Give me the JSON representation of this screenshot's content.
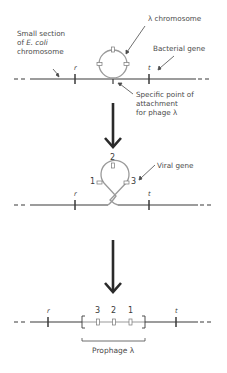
{
  "stage1": {
    "ecoli_label_line1": "Small section",
    "ecoli_label_line2_prefix": "of ",
    "ecoli_label_line2_italic": "E. coli",
    "ecoli_label_line3": "chromosome",
    "lambda_label": "λ chromosome",
    "bacterial_gene_label": "Bacterial gene",
    "attachment_line1": "Specific point of",
    "attachment_line2": "attachment",
    "attachment_line3": "for phage λ",
    "gene_r": "r",
    "gene_t": "t"
  },
  "stage2": {
    "viral_gene_label": "Viral  gene",
    "num1": "1",
    "num2": "2",
    "num3": "3",
    "gene_r": "r",
    "gene_t": "t"
  },
  "stage3": {
    "num3": "3",
    "num2": "2",
    "num1": "1",
    "gene_r": "r",
    "gene_t": "t",
    "prophage_label": "Prophage λ"
  },
  "colors": {
    "line": "#3a3a3a",
    "phage": "#9a9a9a",
    "arrow": "#2a2a2a"
  }
}
